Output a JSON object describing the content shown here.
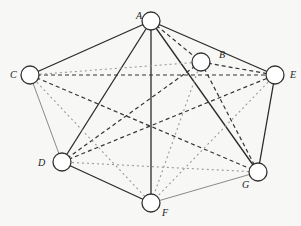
{
  "diagram": {
    "type": "complete-graph",
    "nodes": [
      {
        "id": "A",
        "label": "A",
        "x": 151,
        "y": 21,
        "lx": 136,
        "ly": 19
      },
      {
        "id": "B",
        "label": "B",
        "x": 201,
        "y": 62,
        "lx": 219,
        "ly": 58
      },
      {
        "id": "C",
        "label": "C",
        "x": 30,
        "y": 75,
        "lx": 10,
        "ly": 78
      },
      {
        "id": "D",
        "label": "D",
        "x": 62,
        "y": 162,
        "lx": 38,
        "ly": 166
      },
      {
        "id": "E",
        "label": "E",
        "x": 275,
        "y": 75,
        "lx": 290,
        "ly": 78
      },
      {
        "id": "F",
        "label": "F",
        "x": 151,
        "y": 203,
        "lx": 162,
        "ly": 216
      },
      {
        "id": "G",
        "label": "G",
        "x": 258,
        "y": 172,
        "lx": 242,
        "ly": 188
      }
    ],
    "edge_styles": {
      "solid": {
        "color": "#2a2a2a",
        "width": 1.3,
        "dash": ""
      },
      "thin": {
        "color": "#8a8a8a",
        "width": 1.0,
        "dash": ""
      },
      "dashed": {
        "color": "#333333",
        "width": 1.2,
        "dash": "4,3"
      },
      "dotted": {
        "color": "#9a9a9a",
        "width": 1.1,
        "dash": "2,3"
      }
    },
    "edges": [
      {
        "from": "A",
        "to": "C",
        "style": "solid"
      },
      {
        "from": "A",
        "to": "D",
        "style": "solid"
      },
      {
        "from": "A",
        "to": "F",
        "style": "solid"
      },
      {
        "from": "A",
        "to": "G",
        "style": "solid"
      },
      {
        "from": "A",
        "to": "E",
        "style": "solid"
      },
      {
        "from": "D",
        "to": "F",
        "style": "solid"
      },
      {
        "from": "E",
        "to": "G",
        "style": "solid"
      },
      {
        "from": "C",
        "to": "D",
        "style": "thin"
      },
      {
        "from": "F",
        "to": "G",
        "style": "thin"
      },
      {
        "from": "A",
        "to": "B",
        "style": "dashed"
      },
      {
        "from": "B",
        "to": "E",
        "style": "dashed"
      },
      {
        "from": "B",
        "to": "G",
        "style": "dashed"
      },
      {
        "from": "B",
        "to": "D",
        "style": "dashed"
      },
      {
        "from": "C",
        "to": "E",
        "style": "dashed"
      },
      {
        "from": "C",
        "to": "G",
        "style": "dashed"
      },
      {
        "from": "D",
        "to": "E",
        "style": "dashed"
      },
      {
        "from": "C",
        "to": "B",
        "style": "dotted"
      },
      {
        "from": "C",
        "to": "F",
        "style": "dotted"
      },
      {
        "from": "D",
        "to": "G",
        "style": "dotted"
      },
      {
        "from": "B",
        "to": "F",
        "style": "dotted"
      },
      {
        "from": "E",
        "to": "F",
        "style": "dotted"
      }
    ],
    "node_radius": 9,
    "node_fill": "#ffffff",
    "node_stroke": "#333333"
  }
}
